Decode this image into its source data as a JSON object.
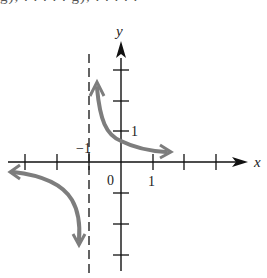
{
  "cropped_header_text": "g), . . . . . g), . . . . .",
  "axes": {
    "x_label": "x",
    "y_label": "y",
    "origin_label": "0",
    "x_tick_label_1": "1",
    "y_tick_label_1": "1",
    "asymptote_label": "−1"
  },
  "colors": {
    "axis": "#111111",
    "curve": "#7d7d7d",
    "asymptote": "#222222"
  },
  "graph": {
    "vertical_asymptote_x": -1,
    "horizontal_asymptote_y": 0,
    "x_ticks": [
      -3,
      -2,
      -1,
      1,
      2,
      3
    ],
    "y_ticks": [
      -3,
      -2,
      -1,
      1,
      2,
      3
    ],
    "branches": [
      {
        "name": "right-branch",
        "description": "from top near x=-1 down through y-intercept ≈0.7, approaching x-axis toward +x"
      },
      {
        "name": "left-branch",
        "description": "from left near x-axis, curving down toward asymptote x=-1"
      }
    ]
  }
}
